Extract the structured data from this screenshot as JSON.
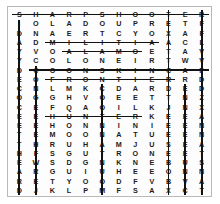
{
  "puzzle": {
    "type": "word-search",
    "title": "Word Search Grid",
    "columns": 12,
    "rows": 20,
    "grid": [
      [
        "S",
        "H",
        "A",
        "R",
        "P",
        "S",
        "H",
        "O",
        "O",
        "T",
        "E",
        "R"
      ],
      [
        "I",
        "O",
        "L",
        "A",
        "D",
        "O",
        "U",
        "P",
        "R",
        "E",
        "T",
        "F"
      ],
      [
        "D",
        "N",
        "A",
        "E",
        "R",
        "T",
        "C",
        "Y",
        "O",
        "X",
        "A",
        "F"
      ],
      [
        "A",
        "D",
        "M",
        "I",
        "L",
        "I",
        "T",
        "I",
        "A",
        "A",
        "C",
        "L"
      ],
      [
        "Y",
        "V",
        "O",
        "A",
        "L",
        "A",
        "M",
        "O",
        "E",
        "T",
        "A",
        "V"
      ],
      [
        "Y",
        "C",
        "O",
        "L",
        "O",
        "N",
        "E",
        "I",
        "R",
        "T",
        "W",
        "V"
      ],
      [
        "D",
        "C",
        "O",
        "O",
        "N",
        "S",
        "K",
        "I",
        "N",
        "C",
        "A",
        "P"
      ],
      [
        "E",
        "O",
        "F",
        "R",
        "O",
        "N",
        "T",
        "I",
        "E",
        "R",
        "R",
        "D"
      ],
      [
        "C",
        "N",
        "L",
        "M",
        "K",
        "C",
        "D",
        "A",
        "R",
        "D",
        "E",
        "D"
      ],
      [
        "O",
        "G",
        "G",
        "H",
        "V",
        "O",
        "E",
        "E",
        "T",
        "T",
        "N",
        "Z"
      ],
      [
        "C",
        "E",
        "F",
        "Q",
        "A",
        "O",
        "I",
        "L",
        "K",
        "J",
        "N",
        "X"
      ],
      [
        "E",
        "E",
        "H",
        "U",
        "N",
        "T",
        "E",
        "R",
        "K",
        "E",
        "E",
        "A"
      ],
      [
        "E",
        "E",
        "H",
        "O",
        "N",
        "N",
        "I",
        "N",
        "I",
        "E",
        "E",
        "N"
      ],
      [
        "T",
        "E",
        "M",
        "O",
        "O",
        "N",
        "A",
        "T",
        "U",
        "E",
        "E",
        "N"
      ],
      [
        "T",
        "H",
        "R",
        "U",
        "H",
        "A",
        "M",
        "J",
        "U",
        "S",
        "E",
        "A"
      ],
      [
        "H",
        "F",
        "S",
        "G",
        "U",
        "T",
        "R",
        "O",
        "N",
        "E",
        "E",
        "T"
      ],
      [
        "E",
        "W",
        "S",
        "D",
        "G",
        "N",
        "K",
        "N",
        "E",
        "B",
        "U",
        "S"
      ],
      [
        "A",
        "R",
        "G",
        "U",
        "I",
        "U",
        "H",
        "E",
        "E",
        "O",
        "N",
        "N"
      ],
      [
        "R",
        "E",
        "T",
        "Y",
        "O",
        "O",
        "D",
        "F",
        "V",
        "B",
        "V",
        "A"
      ],
      [
        "D",
        "J",
        "K",
        "L",
        "P",
        "M",
        "F",
        "S",
        "A",
        "X",
        "C",
        "T"
      ]
    ],
    "found_words": [
      {
        "word": "SHARPSHOOTER",
        "direction": "horizontal",
        "row": 0,
        "col_start": 0,
        "col_end": 11
      },
      {
        "word": "MILITIA",
        "direction": "horizontal",
        "row": 3,
        "col_start": 2,
        "col_end": 8
      },
      {
        "word": "ALAMO",
        "direction": "horizontal",
        "row": 4,
        "col_start": 3,
        "col_end": 7
      },
      {
        "word": "COONSKINCAP",
        "direction": "horizontal",
        "row": 6,
        "col_start": 1,
        "col_end": 11
      },
      {
        "word": "FRONTIER",
        "direction": "horizontal",
        "row": 7,
        "col_start": 2,
        "col_end": 9
      },
      {
        "word": "HUNTER",
        "direction": "horizontal",
        "row": 11,
        "col_start": 2,
        "col_end": 7
      },
      {
        "word": "DAVYCROCKETTHEARD",
        "direction": "vertical",
        "row_start": 1,
        "row_end": 19,
        "col": 0
      },
      {
        "word": "CONGRESS",
        "direction": "vertical",
        "row_start": 6,
        "row_end": 19,
        "col": 1
      },
      {
        "word": "COONMOUNTAIN",
        "direction": "vertical",
        "row_start": 8,
        "row_end": 19,
        "col": 5
      },
      {
        "word": "TEXASSTATE",
        "direction": "vertical",
        "row_start": 0,
        "row_end": 19,
        "col": 9
      },
      {
        "word": "ENNESSEE",
        "direction": "vertical",
        "row_start": 8,
        "row_end": 19,
        "col": 10
      },
      {
        "word": "FRONTIERSMAN",
        "direction": "vertical",
        "row_start": 0,
        "row_end": 19,
        "col": 11
      }
    ]
  },
  "colors": {
    "ink": "#1b1b1b",
    "strike": "#111111",
    "frame": "#b9b9b9",
    "background": "#ffffff"
  }
}
